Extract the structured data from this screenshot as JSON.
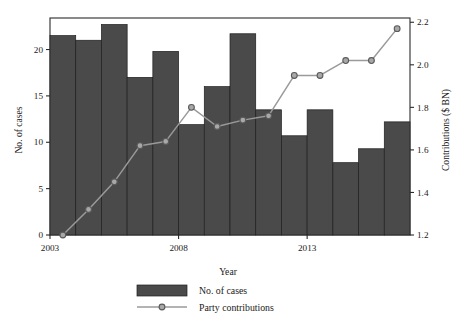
{
  "chart_data": {
    "type": "bar",
    "title": "",
    "subtitle": "",
    "xlabel": "Year",
    "ylabel": "No. of cases",
    "y2label": "Contributions ($ BN)",
    "categories": [
      "2003",
      "2004",
      "2005",
      "2006",
      "2007",
      "2008",
      "2009",
      "2010",
      "2011",
      "2012",
      "2013",
      "2014",
      "2015",
      "2016"
    ],
    "x_tick_labels": [
      "2003",
      "2008",
      "2013"
    ],
    "x_tick_values": [
      2003,
      2008,
      2013
    ],
    "y_tick_labels": [
      "0",
      "5",
      "10",
      "15",
      "20"
    ],
    "y_tick_values": [
      0,
      5,
      10,
      15,
      20
    ],
    "ylim": [
      0,
      23.4
    ],
    "y2_tick_labels": [
      "1.2",
      "1.4",
      "1.6",
      "1.8",
      "2.0",
      "2.2"
    ],
    "y2_tick_values": [
      1.2,
      1.4,
      1.6,
      1.8,
      2.0,
      2.2
    ],
    "y2lim": [
      1.2,
      2.22
    ],
    "grid": false,
    "legend_position": "bottom",
    "series": [
      {
        "name": "No. of cases",
        "type": "bar",
        "axis": "left",
        "color": "#4a4a4a",
        "edge_color": "#1e1e1e",
        "values": [
          21.5,
          21.0,
          22.7,
          17.0,
          19.8,
          11.9,
          16.0,
          21.7,
          13.5,
          10.7,
          13.5,
          7.8,
          9.3,
          12.2
        ]
      },
      {
        "name": "Party contributions",
        "type": "line",
        "axis": "right",
        "color": "#9a9a9a",
        "marker": "circle",
        "marker_face_color": "#a8a8a8",
        "marker_edge_color": "#5a5a5a",
        "values": [
          1.2,
          1.32,
          1.45,
          1.62,
          1.64,
          1.8,
          1.71,
          1.74,
          1.76,
          1.95,
          1.95,
          2.02,
          2.02,
          2.17
        ]
      }
    ]
  },
  "legend": {
    "items": [
      {
        "label": "No. of cases",
        "glyph": "bar-swatch",
        "color": "#4a4a4a"
      },
      {
        "label": "Party contributions",
        "glyph": "line-marker",
        "color": "#9a9a9a"
      }
    ]
  },
  "axes": {
    "left_title": "No. of cases",
    "right_title": "Contributions ($ BN)",
    "bottom_title": "Year"
  },
  "colors": {
    "bar_fill": "#4a4a4a",
    "bar_edge": "#1e1e1e",
    "line": "#9a9a9a",
    "marker_fill": "#a8a8a8",
    "marker_edge": "#5a5a5a",
    "axis": "#2b2b2b",
    "background": "#ffffff"
  }
}
